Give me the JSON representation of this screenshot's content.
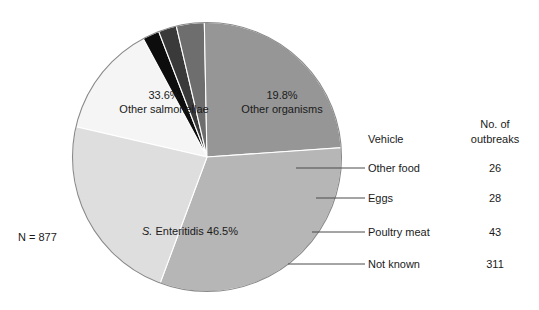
{
  "figure": {
    "total_label": "N = 877"
  },
  "chart_data": {
    "type": "pie",
    "title": "",
    "subtitle": "",
    "xlabel": "",
    "ylabel": "",
    "total_label": "N = 877",
    "total": 877,
    "legend_position": "right",
    "grid": false,
    "categories": [
      "Other organisms",
      "Other food",
      "Eggs",
      "Poultry meat",
      "Not known",
      "S. Enteritidis",
      "Other salmonellae"
    ],
    "values": [
      19.8,
      2.96,
      3.19,
      4.9,
      35.45,
      46.5,
      33.6
    ],
    "slices": [
      {
        "name": "Other organisms",
        "label_line1": "19.8%",
        "label_line2": "Other organisms",
        "percent": 19.8,
        "color": "#f5f5f5",
        "label_x": 282,
        "label_y": 99
      },
      {
        "name": "Other food",
        "label_line1": "",
        "label_line2": "",
        "percent": 2.96,
        "color": "#0d0d0d",
        "label_x": 0,
        "label_y": 0
      },
      {
        "name": "Eggs",
        "label_line1": "",
        "label_line2": "",
        "percent": 3.19,
        "color": "#3a3a3a",
        "label_x": 0,
        "label_y": 0
      },
      {
        "name": "Poultry meat",
        "label_line1": "",
        "label_line2": "",
        "percent": 4.9,
        "color": "#6e6e6e",
        "label_x": 0,
        "label_y": 0
      },
      {
        "name": "Not known",
        "label_line1": "",
        "label_line2": "",
        "percent": 35.45,
        "color": "#969696",
        "label_x": 0,
        "label_y": 0
      },
      {
        "name": "S. Enteritidis",
        "label_line1": "S. Enteritidis 46.5%",
        "label_line2": "",
        "percent": 46.5,
        "color": "#b6b6b6",
        "label_x": 190,
        "label_y": 231
      },
      {
        "name": "Other salmonellae",
        "label_line1": "33.6%",
        "label_line2": "Other salmonellae",
        "percent": 33.6,
        "color": "#dedede",
        "label_x": 164,
        "label_y": 99
      }
    ],
    "legend": {
      "header_vehicle": "Vehicle",
      "header_outbreaks_line1": "No. of",
      "header_outbreaks_line2": "outbreaks",
      "rows": [
        {
          "vehicle": "Other food",
          "outbreaks": "26"
        },
        {
          "vehicle": "Eggs",
          "outbreaks": "28"
        },
        {
          "vehicle": "Poultry meat",
          "outbreaks": "43"
        },
        {
          "vehicle": "Not known",
          "outbreaks": "311"
        }
      ]
    }
  }
}
